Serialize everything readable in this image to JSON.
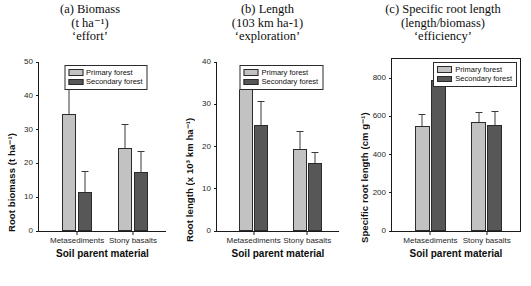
{
  "figure": {
    "xlabel": "Soil parent material",
    "categories": [
      "Metasediments",
      "Stony basalts"
    ],
    "legend": {
      "primary": "Primary forest",
      "secondary": "Secondary forest"
    },
    "colors": {
      "primary": "#c2c2c2",
      "secondary": "#575757",
      "axis": "#1a1a1a"
    }
  },
  "panels": {
    "a": {
      "title_line1": "(a) Biomass",
      "title_line2": "(t ha⁻¹)",
      "title_line3": "‘effort’",
      "ylabel": "Root biomass (t ha⁻¹)",
      "yticks": [
        "0",
        "10",
        "20",
        "30",
        "40",
        "50"
      ]
    },
    "b": {
      "title_line1": "(b) Length",
      "title_line2": "(103 km ha-1)",
      "title_line3": "‘exploration’",
      "ylabel": "Root length (x 10³ km ha⁻¹)",
      "yticks": [
        "0",
        "10",
        "20",
        "30",
        "40"
      ]
    },
    "c": {
      "title_line1": "(c) Specific root length",
      "title_line2": "(length/biomass)",
      "title_line3": "‘efficiency’",
      "ylabel": "Specific root length (cm g⁻¹)",
      "yticks": [
        "0",
        "200",
        "400",
        "600",
        "800"
      ]
    }
  },
  "chart_data": [
    {
      "type": "bar",
      "panel": "a",
      "title": "(a) Biomass (t ha-1) 'effort'",
      "xlabel": "Soil parent material",
      "ylabel": "Root biomass (t ha-1)",
      "categories": [
        "Metasediments",
        "Stony basalts"
      ],
      "ylim": [
        0,
        50
      ],
      "yticks": [
        0,
        10,
        20,
        30,
        40,
        50
      ],
      "grid": false,
      "legend_position": "top-center",
      "series": [
        {
          "name": "Primary forest",
          "values": [
            34.5,
            24.5
          ],
          "errors": [
            12.0,
            7.0
          ],
          "color": "#c2c2c2"
        },
        {
          "name": "Secondary forest",
          "values": [
            11.5,
            17.5
          ],
          "errors": [
            6.0,
            6.0
          ],
          "color": "#575757"
        }
      ]
    },
    {
      "type": "bar",
      "panel": "b",
      "title": "(b) Length (103 km ha-1) 'exploration'",
      "xlabel": "Soil parent material",
      "ylabel": "Root length (x 103 km ha-1)",
      "categories": [
        "Metasediments",
        "Stony basalts"
      ],
      "ylim": [
        0,
        40
      ],
      "yticks": [
        0,
        10,
        20,
        30,
        40
      ],
      "grid": false,
      "legend_position": "top-center",
      "series": [
        {
          "name": "Primary forest",
          "values": [
            33.5,
            19.5
          ],
          "errors": [
            3.0,
            4.0
          ],
          "color": "#c2c2c2"
        },
        {
          "name": "Secondary forest",
          "values": [
            25.0,
            16.0
          ],
          "errors": [
            5.5,
            2.5
          ],
          "color": "#575757"
        }
      ]
    },
    {
      "type": "bar",
      "panel": "c",
      "title": "(c) Specific root length (length/biomass) 'efficiency'",
      "xlabel": "Soil parent material",
      "ylabel": "Specific root length (cm g-1)",
      "categories": [
        "Metasediments",
        "Stony basalts"
      ],
      "ylim": [
        0,
        900
      ],
      "yticks": [
        0,
        200,
        400,
        600,
        800
      ],
      "grid": false,
      "legend_position": "top-right",
      "series": [
        {
          "name": "Primary forest",
          "values": [
            550,
            570
          ],
          "errors": [
            55,
            50
          ],
          "color": "#c2c2c2"
        },
        {
          "name": "Secondary forest",
          "values": [
            790,
            555
          ],
          "errors": [
            75,
            70
          ],
          "color": "#575757"
        }
      ]
    }
  ]
}
